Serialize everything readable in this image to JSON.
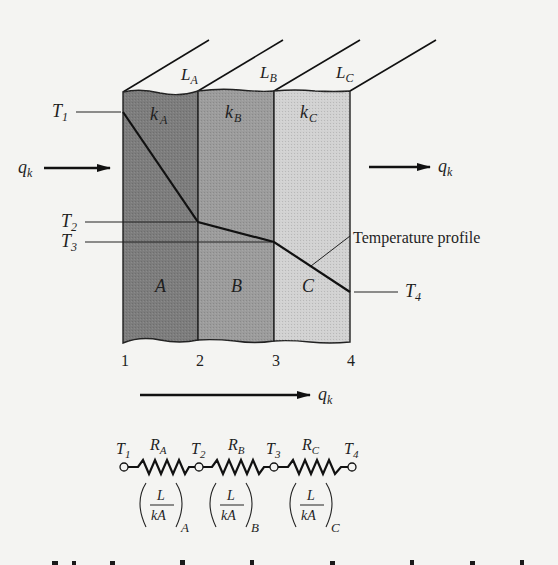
{
  "diagram": {
    "slabs": [
      {
        "name": "A",
        "conductivity": "k",
        "conductivity_sub": "A",
        "thickness": "L",
        "thickness_sub": "A",
        "color": "#7d7d7d"
      },
      {
        "name": "B",
        "conductivity": "k",
        "conductivity_sub": "B",
        "thickness": "L",
        "thickness_sub": "B",
        "color": "#9c9c9c"
      },
      {
        "name": "C",
        "conductivity": "k",
        "conductivity_sub": "C",
        "thickness": "L",
        "thickness_sub": "C",
        "color": "#cfcfcf"
      }
    ],
    "temperatures": [
      {
        "label": "T",
        "sub": "1"
      },
      {
        "label": "T",
        "sub": "2"
      },
      {
        "label": "T",
        "sub": "3"
      },
      {
        "label": "T",
        "sub": "4"
      }
    ],
    "positions": [
      "1",
      "2",
      "3",
      "4"
    ],
    "heat_flow": {
      "label": "q",
      "sub": "k"
    },
    "profile_label": "Temperature profile",
    "circuit": {
      "nodes": [
        {
          "label": "T",
          "sub": "1"
        },
        {
          "label": "T",
          "sub": "2"
        },
        {
          "label": "T",
          "sub": "3"
        },
        {
          "label": "T",
          "sub": "4"
        }
      ],
      "resistors": [
        {
          "label": "R",
          "sub": "A",
          "formula_num": "L",
          "formula_den": "kA",
          "formula_sub": "A"
        },
        {
          "label": "R",
          "sub": "B",
          "formula_num": "L",
          "formula_den": "kA",
          "formula_sub": "B"
        },
        {
          "label": "R",
          "sub": "C",
          "formula_num": "L",
          "formula_den": "kA",
          "formula_sub": "C"
        }
      ]
    }
  }
}
